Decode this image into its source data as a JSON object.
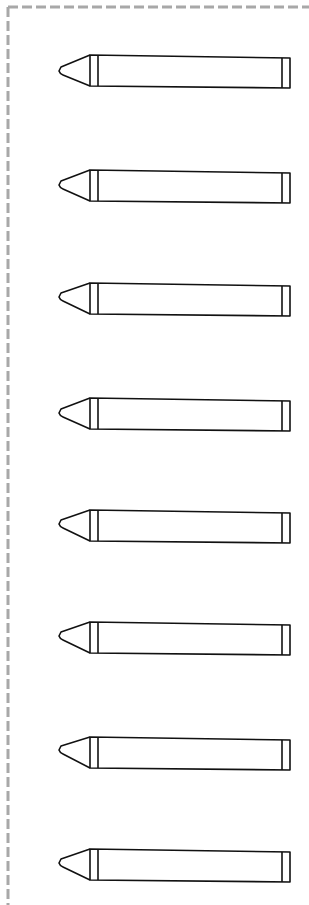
{
  "worksheet": {
    "border": {
      "style": "dashed",
      "color": "#a8a8a8",
      "sides": [
        "top",
        "left"
      ]
    },
    "stroke_color": "#111111",
    "crayons": [
      {
        "top": 55,
        "bottom": 86,
        "tip_y": 70
      },
      {
        "top": 170,
        "bottom": 201,
        "tip_y": 184
      },
      {
        "top": 283,
        "bottom": 314,
        "tip_y": 296
      },
      {
        "top": 398,
        "bottom": 429,
        "tip_y": 412
      },
      {
        "top": 510,
        "bottom": 541,
        "tip_y": 523
      },
      {
        "top": 622,
        "bottom": 653,
        "tip_y": 635
      },
      {
        "top": 737,
        "bottom": 768,
        "tip_y": 749
      },
      {
        "top": 849,
        "bottom": 880,
        "tip_y": 862
      }
    ]
  }
}
